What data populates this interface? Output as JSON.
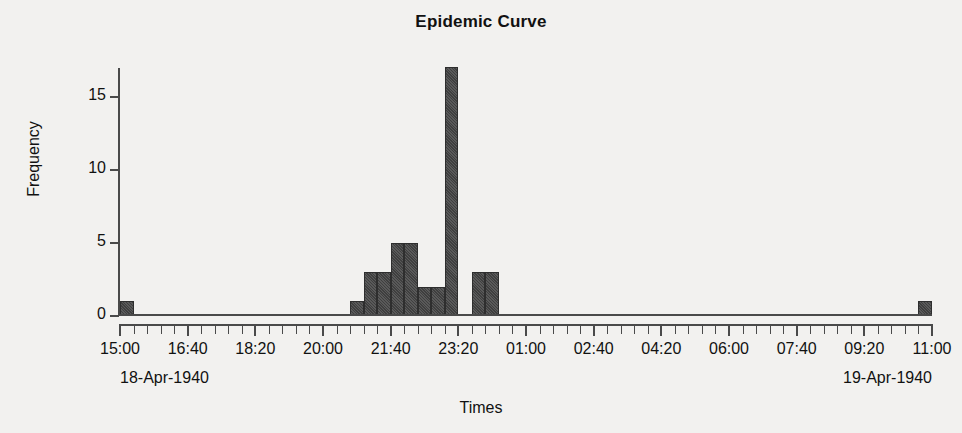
{
  "chart_data": {
    "type": "bar",
    "title": "Epidemic Curve",
    "xlabel": "Times",
    "ylabel": "Frequency",
    "ylim": [
      0,
      17.5
    ],
    "yticks": [
      0,
      5,
      10,
      15
    ],
    "grid": false,
    "legend": null,
    "bin_minutes": 20,
    "x_range_start": "15:00",
    "x_range_end": "11:00",
    "xticklabels": [
      "15:00",
      "16:40",
      "18:20",
      "20:00",
      "21:40",
      "23:20",
      "01:00",
      "02:40",
      "04:20",
      "06:00",
      "07:40",
      "09:20",
      "11:00"
    ],
    "xtick_minutes_from_start": [
      0,
      100,
      200,
      300,
      400,
      500,
      600,
      700,
      800,
      900,
      1000,
      1100,
      1200
    ],
    "date_start_label": "18-Apr-1940",
    "date_end_label": "19-Apr-1940",
    "bar_color": "#4d4d4d",
    "bar_edge_color": "#2e2e2e",
    "background_color": "#f2f1ef",
    "axis_color": "#4a4a4a",
    "bins": [
      {
        "start": "15:00",
        "minutes_from_start": 0,
        "value": 1
      },
      {
        "start": "20:40",
        "minutes_from_start": 340,
        "value": 1
      },
      {
        "start": "21:00",
        "minutes_from_start": 360,
        "value": 3
      },
      {
        "start": "21:20",
        "minutes_from_start": 380,
        "value": 3
      },
      {
        "start": "21:40",
        "minutes_from_start": 400,
        "value": 5
      },
      {
        "start": "22:00",
        "minutes_from_start": 420,
        "value": 5
      },
      {
        "start": "22:20",
        "minutes_from_start": 440,
        "value": 2
      },
      {
        "start": "22:40",
        "minutes_from_start": 460,
        "value": 2
      },
      {
        "start": "23:00",
        "minutes_from_start": 480,
        "value": 17
      },
      {
        "start": "23:40",
        "minutes_from_start": 520,
        "value": 3
      },
      {
        "start": "00:00",
        "minutes_from_start": 540,
        "value": 3
      },
      {
        "start": "10:40",
        "minutes_from_start": 1180,
        "value": 1
      }
    ],
    "values": [
      1,
      0,
      0,
      0,
      0,
      0,
      0,
      0,
      0,
      0,
      0,
      0,
      0,
      0,
      0,
      0,
      0,
      1,
      3,
      3,
      5,
      5,
      2,
      2,
      17,
      0,
      3,
      3,
      0,
      0,
      0,
      0,
      0,
      0,
      0,
      0,
      0,
      0,
      0,
      0,
      0,
      0,
      0,
      0,
      0,
      0,
      0,
      0,
      0,
      0,
      0,
      0,
      0,
      0,
      0,
      0,
      0,
      0,
      0,
      1
    ],
    "total_count": 46
  }
}
